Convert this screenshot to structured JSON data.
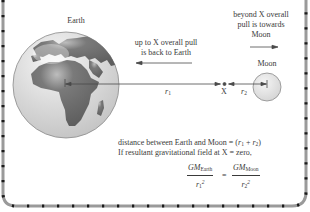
{
  "diagram": {
    "type": "physics-figure",
    "colors": {
      "border_gray": "#9a9a9a",
      "border_dot": "#1a1a1a",
      "earth_ocean": "#d9d9d9",
      "earth_land": "#6e6e6e",
      "moon_fill": "#e4e4e4",
      "line": "#4a4a4a",
      "text": "#3a3a3a"
    }
  },
  "labels": {
    "earth": "Earth",
    "moon": "Moon",
    "point_x": "X",
    "r1": "r",
    "r1_sub": "1",
    "r2": "r",
    "r2_sub": "2",
    "left_note_line1": "up to X overall pull",
    "left_note_line2": "is back to Earth",
    "right_note_line1": "beyond X overall",
    "right_note_line2": "pull is towards",
    "right_note_line3": "Moon"
  },
  "explanation": {
    "line1_prefix": "distance between Earth and Moon = (",
    "line1_r1": "r",
    "line1_r1_sub": "1",
    "line1_plus": " + ",
    "line1_r2": "r",
    "line1_r2_sub": "2",
    "line1_suffix": ")",
    "line2": "If resultant gravitational field at X = zero,"
  },
  "equation": {
    "left_numerator_gm": "GM",
    "left_numerator_sub": "Earth",
    "left_denominator_r": "r",
    "left_denominator_sub": "1",
    "left_denominator_sup": "2",
    "equals": "=",
    "right_numerator_gm": "GM",
    "right_numerator_sub": "Moon",
    "right_denominator_r": "r",
    "right_denominator_sub": "2",
    "right_denominator_sup": "2"
  }
}
